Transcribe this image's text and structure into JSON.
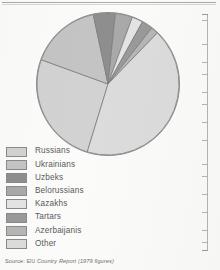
{
  "chart_data": {
    "type": "pie",
    "title": "",
    "subtitle": "",
    "xlabel": "",
    "ylabel": "",
    "legend_position": "bottom-left",
    "grid": false,
    "categories": [
      "Russians",
      "Ukrainians",
      "Uzbeks",
      "Belorussians",
      "Kazakhs",
      "Tartars",
      "Azerbaijanis",
      "Other"
    ],
    "values": [
      52,
      16,
      5,
      4,
      2.5,
      2.5,
      1.5,
      16.5
    ],
    "unit": "percent",
    "colors": [
      "#d2d2d2",
      "#c4c4c4",
      "#8e8e8e",
      "#a9a9a9",
      "#e4e4e4",
      "#9a9a9a",
      "#b6b6b6",
      "#dcdcdc"
    ],
    "slices": [
      {
        "label": "Russians",
        "value": 52,
        "color": "#d2d2d2",
        "start_angle": 253,
        "end_angle": 160
      },
      {
        "label": "Ukrainians",
        "value": 16,
        "color": "#c4c4c4",
        "start_angle": 160,
        "end_angle": 102
      },
      {
        "label": "Uzbeks",
        "value": 5,
        "color": "#8e8e8e",
        "start_angle": 102,
        "end_angle": 84
      },
      {
        "label": "Belorussians",
        "value": 4,
        "color": "#a9a9a9",
        "start_angle": 84,
        "end_angle": 70
      },
      {
        "label": "Kazakhs",
        "value": 2.5,
        "color": "#e4e4e4",
        "start_angle": 70,
        "end_angle": 61
      },
      {
        "label": "Tartars",
        "value": 2.5,
        "color": "#9a9a9a",
        "start_angle": 61,
        "end_angle": 52
      },
      {
        "label": "Azerbaijanis",
        "value": 1.5,
        "color": "#b6b6b6",
        "start_angle": 52,
        "end_angle": 46
      },
      {
        "label": "Other",
        "value": 16.5,
        "color": "#dcdcdc",
        "start_angle": 46,
        "end_angle": 253
      }
    ]
  },
  "legend": {
    "items": [
      {
        "label": "Russians",
        "color": "#d2d2d2"
      },
      {
        "label": "Ukrainians",
        "color": "#c4c4c4"
      },
      {
        "label": "Uzbeks",
        "color": "#8e8e8e"
      },
      {
        "label": "Belorussians",
        "color": "#a9a9a9"
      },
      {
        "label": "Kazakhs",
        "color": "#e4e4e4"
      },
      {
        "label": "Tartars",
        "color": "#9a9a9a"
      },
      {
        "label": "Azerbaijanis",
        "color": "#b6b6b6"
      },
      {
        "label": "Other",
        "color": "#dcdcdc"
      }
    ]
  },
  "source": {
    "label": "Source:",
    "publisher": "EIU",
    "publication": "Country Report",
    "note": "(1979 figures)"
  }
}
